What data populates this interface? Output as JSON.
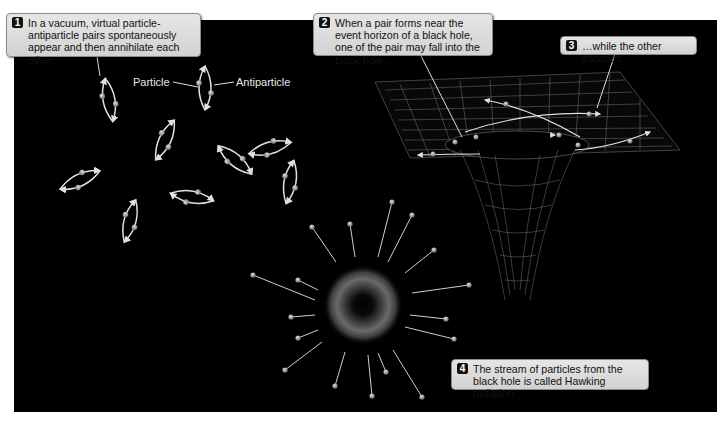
{
  "callouts": [
    {
      "number": "1",
      "text": "In a vacuum, virtual particle-antiparticle pairs spontaneously appear and then annihilate each other."
    },
    {
      "number": "2",
      "text": "When a pair forms near the event horizon of a black hole, one of the pair may fall into the black hole…"
    },
    {
      "number": "3",
      "text": "…while the other escapes."
    },
    {
      "number": "4",
      "text": "The stream of particles from the black hole is called Hawking radiation."
    }
  ],
  "labels": {
    "particle": "Particle",
    "antiparticle": "Antiparticle"
  },
  "colors": {
    "background": "#000000",
    "callout_fill": "#dcdcdc",
    "lines": "#e0e0e0",
    "particle": "#9a9a9a"
  }
}
